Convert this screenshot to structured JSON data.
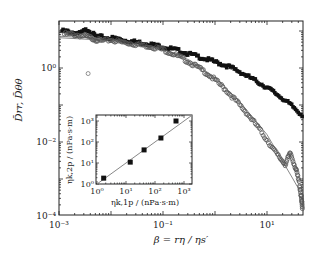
{
  "chart_data": [
    {
      "type": "scatter",
      "title": "",
      "xlabel": "β = rη / ηs′",
      "ylabel": "D̄rr, D̄θθ",
      "xscale": "log",
      "yscale": "log",
      "xlim": [
        0.001,
        50
      ],
      "ylim": [
        0.0001,
        18
      ],
      "x_ticks": [
        "10⁻³",
        "10⁻¹",
        "10¹"
      ],
      "x_tick_values": [
        0.001,
        0.1,
        10
      ],
      "y_ticks": [
        "10⁰",
        "10⁻²",
        "10⁻⁴"
      ],
      "y_tick_values": [
        1,
        0.01,
        0.0001
      ],
      "grid": false,
      "legend": null,
      "series": [
        {
          "name": "D̄rr (filled markers)",
          "marker": "filled",
          "color": "#111111",
          "log_points": [
            [
              -2.94,
              1.0
            ],
            [
              -2.8,
              0.98
            ],
            [
              -2.6,
              0.93
            ],
            [
              -2.45,
              1.05
            ],
            [
              -2.3,
              0.86
            ],
            [
              -2.1,
              0.82
            ],
            [
              -1.9,
              0.8
            ],
            [
              -1.7,
              0.74
            ],
            [
              -1.5,
              0.7
            ],
            [
              -1.3,
              0.66
            ],
            [
              -1.1,
              0.6
            ],
            [
              -0.9,
              0.54
            ],
            [
              -0.7,
              0.47
            ],
            [
              -0.5,
              0.38
            ],
            [
              -0.3,
              0.3
            ],
            [
              -0.1,
              0.21
            ],
            [
              0.1,
              0.12
            ],
            [
              0.3,
              0.02
            ],
            [
              0.5,
              -0.12
            ],
            [
              0.7,
              -0.28
            ],
            [
              0.9,
              -0.44
            ],
            [
              1.1,
              -0.62
            ],
            [
              1.3,
              -0.82
            ],
            [
              1.5,
              -1.05
            ],
            [
              1.7,
              -1.3
            ]
          ]
        },
        {
          "name": "D̄θθ (open markers)",
          "marker": "open",
          "color": "#555555",
          "log_points": [
            [
              -2.9,
              0.92
            ],
            [
              -2.7,
              0.9
            ],
            [
              -2.5,
              0.86
            ],
            [
              -2.35,
              0.8
            ],
            [
              -2.2,
              0.73
            ],
            [
              -2.0,
              0.76
            ],
            [
              -1.8,
              0.7
            ],
            [
              -1.6,
              0.66
            ],
            [
              -1.4,
              0.62
            ],
            [
              -1.2,
              0.57
            ],
            [
              -1.0,
              0.5
            ],
            [
              -0.8,
              0.38
            ],
            [
              -0.6,
              0.24
            ],
            [
              -0.4,
              0.08
            ],
            [
              -0.2,
              -0.1
            ],
            [
              0.0,
              -0.32
            ],
            [
              0.2,
              -0.58
            ],
            [
              0.4,
              -0.88
            ],
            [
              0.6,
              -1.2
            ],
            [
              0.8,
              -1.55
            ],
            [
              1.0,
              -1.95
            ],
            [
              1.2,
              -2.35
            ],
            [
              1.35,
              -2.6
            ],
            [
              1.45,
              -2.3
            ],
            [
              1.55,
              -2.7
            ],
            [
              1.62,
              -3.1
            ],
            [
              1.66,
              -3.5
            ],
            [
              1.68,
              -3.8
            ]
          ]
        },
        {
          "name": "outlier",
          "marker": "open",
          "color": "#777777",
          "log_points": [
            [
              -2.44,
              -0.15
            ]
          ]
        }
      ],
      "fit_lines": [
        {
          "name": "fit Drr",
          "color": "#888888",
          "log_points": [
            [
              -3,
              0.86
            ],
            [
              -2,
              0.78
            ],
            [
              -1.5,
              0.72
            ],
            [
              -1,
              0.6
            ],
            [
              -0.5,
              0.4
            ],
            [
              0,
              0.15
            ],
            [
              0.5,
              -0.15
            ],
            [
              1,
              -0.55
            ],
            [
              1.5,
              -1.05
            ],
            [
              1.7,
              -1.3
            ]
          ]
        },
        {
          "name": "fit Dθθ",
          "color": "#888888",
          "log_points": [
            [
              -3,
              0.82
            ],
            [
              -2,
              0.74
            ],
            [
              -1.5,
              0.68
            ],
            [
              -1,
              0.52
            ],
            [
              -0.5,
              0.22
            ],
            [
              0,
              -0.25
            ],
            [
              0.5,
              -0.95
            ],
            [
              1,
              -1.8
            ],
            [
              1.5,
              -3.0
            ],
            [
              1.58,
              -3.2
            ]
          ]
        }
      ]
    },
    {
      "type": "scatter",
      "title": "inset",
      "xlabel": "ηk,1p / (nPa·s·m)",
      "ylabel": "ηk,2p / (nPa·s·m)",
      "xscale": "log",
      "yscale": "log",
      "xlim": [
        1,
        1500
      ],
      "ylim": [
        1,
        1500
      ],
      "x_ticks": [
        "10⁰",
        "10¹",
        "10²",
        "10³"
      ],
      "y_ticks": [
        "10⁰",
        "10¹",
        "10²",
        "10³"
      ],
      "series": [
        {
          "name": "data",
          "marker": "filled-square",
          "x": [
            1.7,
            14,
            42,
            160,
            530
          ],
          "y": [
            1.9,
            11,
            42,
            155,
            1000
          ]
        }
      ],
      "fit_line": {
        "name": "y = x",
        "x": [
          1,
          1500
        ],
        "y": [
          1,
          1500
        ],
        "color": "#888888"
      }
    }
  ],
  "labels": {
    "xlabel": "β = rη / ηs′",
    "ylabel": "D̄rr, D̄θθ",
    "inset_xlabel": "ηk,1p / (nPa·s·m)",
    "inset_ylabel": "ηk,2p / (nPa·s·m)"
  }
}
